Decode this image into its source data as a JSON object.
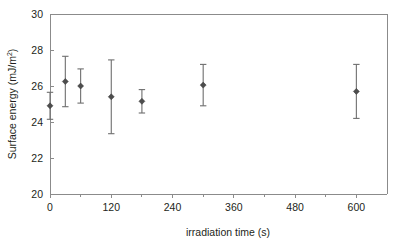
{
  "chart_data": {
    "type": "scatter",
    "title": "",
    "xlabel": "irradiation time   (s)",
    "ylabel_main": "Surface energy",
    "ylabel_units": "(mJ/m",
    "ylabel_units_sup": "2",
    "ylabel_units_close": ")",
    "ylabel_full": "Surface energy  (mJ/m2)",
    "xlim": [
      0,
      660
    ],
    "ylim": [
      20,
      30
    ],
    "xticks": [
      0,
      120,
      240,
      360,
      480,
      600
    ],
    "xtick_labels": [
      "0",
      "120",
      "240",
      "360",
      "480",
      "600"
    ],
    "x_minor_ticks": [
      60,
      180,
      300,
      420,
      540
    ],
    "yticks": [
      20,
      22,
      24,
      26,
      28,
      30
    ],
    "ytick_labels": [
      "20",
      "22",
      "24",
      "26",
      "28",
      "30"
    ],
    "grid": false,
    "legend": "none",
    "marker_style": "filled-diamond",
    "error_bars": "symmetric",
    "x": [
      0,
      30,
      60,
      120,
      180,
      300,
      600
    ],
    "values": [
      24.9,
      26.25,
      26.0,
      25.4,
      25.15,
      26.05,
      25.7
    ],
    "yerr": [
      0.75,
      1.4,
      0.95,
      2.05,
      0.65,
      1.15,
      1.5
    ],
    "points": [
      {
        "x": 0,
        "y": 24.9,
        "err": 0.75
      },
      {
        "x": 30,
        "y": 26.25,
        "err": 1.4
      },
      {
        "x": 60,
        "y": 26.0,
        "err": 0.95
      },
      {
        "x": 120,
        "y": 25.4,
        "err": 2.05
      },
      {
        "x": 180,
        "y": 25.15,
        "err": 0.65
      },
      {
        "x": 300,
        "y": 26.05,
        "err": 1.15
      },
      {
        "x": 600,
        "y": 25.7,
        "err": 1.5
      }
    ],
    "colors": {
      "axis": "#8b8b8b",
      "marker": "#4d4d4d",
      "errorbar": "#6e6e6e",
      "text": "#231f20",
      "background": "#ffffff"
    }
  }
}
